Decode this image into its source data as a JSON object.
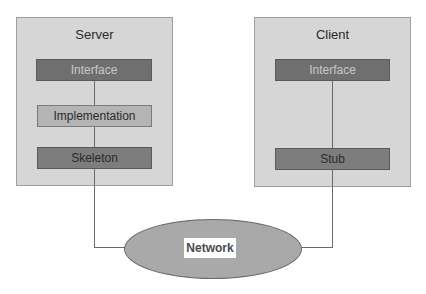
{
  "diagram": {
    "server": {
      "title": "Server",
      "components": [
        {
          "label": "Interface"
        },
        {
          "label": "Implementation"
        },
        {
          "label": "Skeleton"
        }
      ]
    },
    "client": {
      "title": "Client",
      "components": [
        {
          "label": "Interface"
        },
        {
          "label": "Stub"
        }
      ]
    },
    "network": {
      "label": "Network"
    },
    "colors": {
      "container_fill": "#d6d6d6",
      "dark_component": "#6f6f6f",
      "light_component": "#b4b4b4",
      "network_fill": "#a9a9a9",
      "connector": "#6a6a6a"
    }
  }
}
